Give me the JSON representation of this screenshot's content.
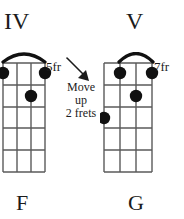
{
  "page": {
    "background_color": "#ffffff",
    "ink_color": "#1b1b1b"
  },
  "chords": [
    {
      "id": "chord-left",
      "roman_numeral": "IV",
      "chord_name": "F",
      "fret_position_label": "5fr",
      "base_fret": 5,
      "strings": 4,
      "frets": 5,
      "barre": {
        "from_string": 1,
        "to_string": 4,
        "fret": 1
      },
      "dots": [
        {
          "string": 1,
          "fret": 1
        },
        {
          "string": 4,
          "fret": 1
        },
        {
          "string": 3,
          "fret": 2
        }
      ]
    },
    {
      "id": "chord-right",
      "roman_numeral": "V",
      "chord_name": "G",
      "fret_position_label": "7fr",
      "base_fret": 7,
      "strings": 4,
      "frets": 5,
      "barre": {
        "from_string": 2,
        "to_string": 4,
        "fret": 1
      },
      "dots": [
        {
          "string": 2,
          "fret": 1
        },
        {
          "string": 4,
          "fret": 1
        },
        {
          "string": 3,
          "fret": 2
        },
        {
          "string": 1,
          "fret": 3
        }
      ]
    }
  ],
  "instruction": {
    "line1": "Move",
    "line2": "up",
    "line3": "2 frets",
    "arrow": "diagonal-down-right-arrow"
  }
}
